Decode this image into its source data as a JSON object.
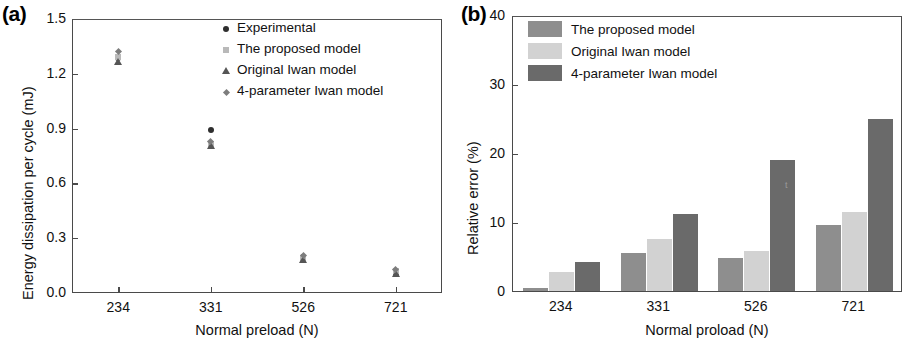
{
  "figure": {
    "panel_a_label": "(a)",
    "panel_b_label": "(b)"
  },
  "chart_data": [
    {
      "type": "scatter",
      "panel": "(a)",
      "title": "",
      "xlabel": "Normal preload (N)",
      "ylabel": "Energy dissipation per cycle (mJ)",
      "categories": [
        "234",
        "331",
        "526",
        "721"
      ],
      "ylim": [
        0.0,
        1.5
      ],
      "yticks": [
        "0.0",
        "0.3",
        "0.6",
        "0.9",
        "1.2",
        "1.5"
      ],
      "ytick_values": [
        0.0,
        0.3,
        0.6,
        0.9,
        1.2,
        1.5
      ],
      "grid": false,
      "legend_position": "top-right",
      "series": [
        {
          "name": "Experimental",
          "marker": "circle",
          "color": "#2e2e2e",
          "values": [
            1.285,
            0.895,
            0.197,
            0.112
          ]
        },
        {
          "name": "The proposed model",
          "marker": "square",
          "color": "#b9b9b9",
          "values": [
            1.29,
            0.818,
            0.193,
            0.118
          ]
        },
        {
          "name": "Original Iwan model",
          "marker": "triangle",
          "color": "#555555",
          "values": [
            1.265,
            0.808,
            0.182,
            0.105
          ]
        },
        {
          "name": "4-parameter Iwan model",
          "marker": "diamond",
          "color": "#7d7d7d",
          "values": [
            1.32,
            0.832,
            0.208,
            0.128
          ]
        }
      ]
    },
    {
      "type": "bar",
      "panel": "(b)",
      "title": "",
      "xlabel": "Normal proload (N)",
      "ylabel": "Relative error (%)",
      "categories": [
        "234",
        "331",
        "526",
        "721"
      ],
      "ylim": [
        0,
        40
      ],
      "yticks": [
        "0",
        "10",
        "20",
        "30",
        "40"
      ],
      "ytick_values": [
        0,
        10,
        20,
        30,
        40
      ],
      "grid": false,
      "legend_position": "top-left",
      "series": [
        {
          "name": "The proposed model",
          "color": "#8e8e8e",
          "values": [
            0.5,
            5.5,
            4.8,
            9.5
          ]
        },
        {
          "name": "Original Iwan model",
          "color": "#d2d2d2",
          "values": [
            2.7,
            7.6,
            5.8,
            11.4
          ]
        },
        {
          "name": "4-parameter Iwan model",
          "color": "#6a6a6a",
          "values": [
            4.2,
            11.2,
            19.0,
            25.0
          ]
        }
      ]
    }
  ]
}
